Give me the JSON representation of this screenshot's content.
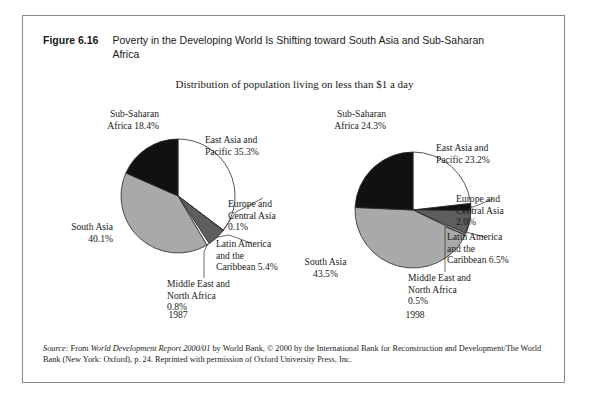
{
  "figure": {
    "number": "Figure 6.16",
    "title": "Poverty in the Developing World Is Shifting toward South Asia and Sub-Saharan Africa",
    "subtitle": "Distribution of population living on less than $1 a day"
  },
  "source": {
    "label": "Source:",
    "text_1": " From ",
    "italic_1": "World Development Report 2000/01",
    "text_2": " by World Bank, © 2000 by the International Bank for Reconstruction and Development/The World Bank (New York: Oxford), p. 24. Reprinted with permission of Oxford University Press, Inc."
  },
  "colors": {
    "white": "#ffffff",
    "black": "#111111",
    "light_gray": "#a9a9a9",
    "dark_gray": "#5e5e5e",
    "outline": "#2b2b2b",
    "frame": "#8a8a8a"
  },
  "labels": {
    "pie1": {
      "sub_saharan": "Sub-Saharan\nAfrica 18.4%",
      "east_asia": "East Asia and\nPacific 35.3%",
      "europe": "Europe and\nCentral Asia\n0.1%",
      "latin": "Latin America\nand the\nCaribbean 5.4%",
      "middle_east": "Middle East and\nNorth Africa\n0.8%",
      "south_asia": "South Asia\n40.1%",
      "year": "1987"
    },
    "pie2": {
      "sub_saharan": "Sub-Saharan\nAfrica 24.3%",
      "east_asia": "East Asia and\nPacific 23.2%",
      "europe": "Europe and\nCentral Asia\n2.0%",
      "latin": "Latin America\nand the\nCaribbean 6.5%",
      "middle_east": "Middle East and\nNorth Africa\n0.5%",
      "south_asia": "South Asia\n43.5%",
      "year": "1998"
    }
  },
  "chart_data": [
    {
      "type": "pie",
      "title": "1987",
      "subtitle": "Distribution of population living on less than $1 a day",
      "unit": "percent",
      "start_angle_deg": 0,
      "direction": "clockwise",
      "categories": [
        "East Asia and Pacific",
        "Europe and Central Asia",
        "Latin America and the Caribbean",
        "Middle East and North Africa",
        "South Asia",
        "Sub-Saharan Africa"
      ],
      "values": [
        35.3,
        0.1,
        5.4,
        0.8,
        40.1,
        18.4
      ],
      "slice_colors": [
        "#ffffff",
        "#111111",
        "#5e5e5e",
        "#ffffff",
        "#a9a9a9",
        "#111111"
      ],
      "legend": "labels placed outside with leader lines"
    },
    {
      "type": "pie",
      "title": "1998",
      "subtitle": "Distribution of population living on less than $1 a day",
      "unit": "percent",
      "start_angle_deg": 0,
      "direction": "clockwise",
      "categories": [
        "East Asia and Pacific",
        "Europe and Central Asia",
        "Latin America and the Caribbean",
        "Middle East and North Africa",
        "South Asia",
        "Sub-Saharan Africa"
      ],
      "values": [
        23.2,
        2.0,
        6.5,
        0.5,
        43.5,
        24.3
      ],
      "slice_colors": [
        "#ffffff",
        "#111111",
        "#5e5e5e",
        "#ffffff",
        "#a9a9a9",
        "#111111"
      ],
      "legend": "labels placed outside with leader lines"
    }
  ]
}
